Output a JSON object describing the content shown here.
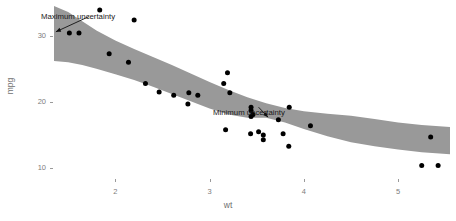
{
  "chart_data": {
    "type": "scatter",
    "title": "",
    "subtitle": "",
    "xlabel": "wt",
    "ylabel": "mpg",
    "xlim": [
      1.35,
      5.55
    ],
    "ylim": [
      8.5,
      34.5
    ],
    "xticks": [
      2,
      3,
      4,
      5
    ],
    "yticks": [
      10,
      20,
      30
    ],
    "xtick_labels": [
      "2",
      "3",
      "4",
      "5"
    ],
    "ytick_labels": [
      "10",
      "20",
      "30"
    ],
    "grid": false,
    "legend": "none",
    "point_color": "#000000",
    "ribbon_color": "#999999",
    "axis_text_color": "#7d7d7d",
    "panel_background": "#ffffff",
    "x": [
      2.62,
      2.875,
      2.32,
      3.215,
      3.44,
      3.46,
      3.57,
      3.19,
      3.15,
      3.44,
      3.44,
      4.07,
      3.73,
      3.78,
      5.25,
      5.424,
      5.345,
      2.2,
      1.615,
      1.835,
      2.465,
      3.52,
      3.435,
      3.84,
      3.845,
      1.935,
      2.14,
      1.513,
      3.17,
      2.77,
      3.57,
      2.78
    ],
    "y": [
      21.0,
      21.0,
      22.8,
      21.4,
      18.7,
      18.1,
      14.3,
      24.4,
      22.8,
      19.2,
      17.8,
      16.4,
      17.3,
      15.2,
      10.4,
      10.4,
      14.7,
      32.4,
      30.4,
      33.9,
      21.5,
      15.5,
      15.2,
      13.3,
      19.2,
      27.3,
      26.0,
      30.4,
      15.8,
      19.7,
      15.0,
      21.4
    ],
    "ribbon": {
      "description": "Confidence band (95%) around a smoothed fit of mpg on wt; widest at the left edge (low wt) and pinched narrowest near wt = 3.6",
      "x": [
        1.35,
        1.5,
        1.65,
        1.8,
        2.0,
        2.2,
        2.4,
        2.6,
        2.8,
        3.0,
        3.2,
        3.4,
        3.6,
        3.8,
        4.0,
        4.25,
        4.5,
        4.75,
        5.0,
        5.25,
        5.55
      ],
      "ymax": [
        34.5,
        33.6,
        32.2,
        30.8,
        29.3,
        28.0,
        26.8,
        25.6,
        24.3,
        23.0,
        21.8,
        20.7,
        19.8,
        19.1,
        18.6,
        18.2,
        17.9,
        17.4,
        16.9,
        16.5,
        16.2
      ],
      "ymin": [
        26.2,
        26.0,
        25.6,
        25.0,
        24.2,
        23.3,
        22.3,
        21.2,
        20.1,
        19.0,
        18.1,
        17.6,
        17.6,
        16.9,
        15.9,
        14.8,
        13.9,
        13.3,
        12.8,
        12.4,
        12.1
      ]
    },
    "annotations": [
      {
        "id": "maximum-uncertainty",
        "text": "Maximum uncertainty",
        "label_x": 1.55,
        "label_y": 33.6,
        "arrow_to_x": 1.37,
        "arrow_to_y": 30.6,
        "arrow": true
      },
      {
        "id": "minimum-uncertainty",
        "text": "Minimum uncertainty",
        "label_x": 3.3,
        "label_y": 19.6,
        "arrow_to_x": 3.62,
        "arrow_to_y": 17.7,
        "arrow": true
      }
    ]
  },
  "axes": {
    "y": {
      "title": "mpg",
      "ticks": [
        {
          "label": "30"
        },
        {
          "label": "20"
        },
        {
          "label": "10"
        }
      ]
    },
    "x": {
      "title": "wt",
      "ticks": [
        {
          "label": "2"
        },
        {
          "label": "3"
        },
        {
          "label": "4"
        },
        {
          "label": "5"
        }
      ]
    }
  }
}
